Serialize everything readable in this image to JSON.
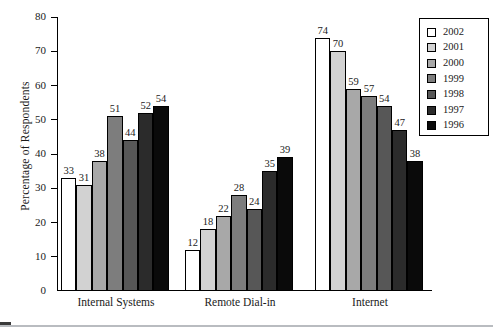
{
  "chart_data": {
    "type": "bar",
    "title": "",
    "subtitle": "",
    "xlabel": "",
    "ylabel": "Percentage of Respondents",
    "categories": [
      "Internal Systems",
      "Remote Dial-in",
      "Internet"
    ],
    "ylim": [
      0,
      80
    ],
    "y_ticks": [
      0,
      10,
      20,
      30,
      40,
      50,
      60,
      70,
      80
    ],
    "grid": false,
    "legend_position": "right",
    "series": [
      {
        "name": "2002",
        "color": "#ffffff",
        "values": [
          33,
          12,
          74
        ]
      },
      {
        "name": "2001",
        "color": "#d2d2d2",
        "values": [
          31,
          18,
          70
        ]
      },
      {
        "name": "2000",
        "color": "#a8a8a8",
        "values": [
          38,
          22,
          59
        ]
      },
      {
        "name": "1999",
        "color": "#7d7d7d",
        "values": [
          51,
          28,
          57
        ]
      },
      {
        "name": "1998",
        "color": "#575757",
        "values": [
          44,
          24,
          54
        ]
      },
      {
        "name": "1997",
        "color": "#2b2b2b",
        "values": [
          52,
          35,
          47
        ]
      },
      {
        "name": "1996",
        "color": "#0a0a0a",
        "values": [
          54,
          39,
          38
        ]
      }
    ]
  },
  "axis": {
    "y_title": "Percentage of Respondents",
    "y_tick_labels": [
      "0",
      "10",
      "20",
      "30",
      "40",
      "50",
      "60",
      "70",
      "80"
    ]
  },
  "legend": {
    "entries": [
      {
        "label": "2002",
        "color": "#ffffff"
      },
      {
        "label": "2001",
        "color": "#d2d2d2"
      },
      {
        "label": "2000",
        "color": "#a8a8a8"
      },
      {
        "label": "1999",
        "color": "#7d7d7d"
      },
      {
        "label": "1998",
        "color": "#575757"
      },
      {
        "label": "1997",
        "color": "#2b2b2b"
      },
      {
        "label": "1996",
        "color": "#0a0a0a"
      }
    ]
  }
}
